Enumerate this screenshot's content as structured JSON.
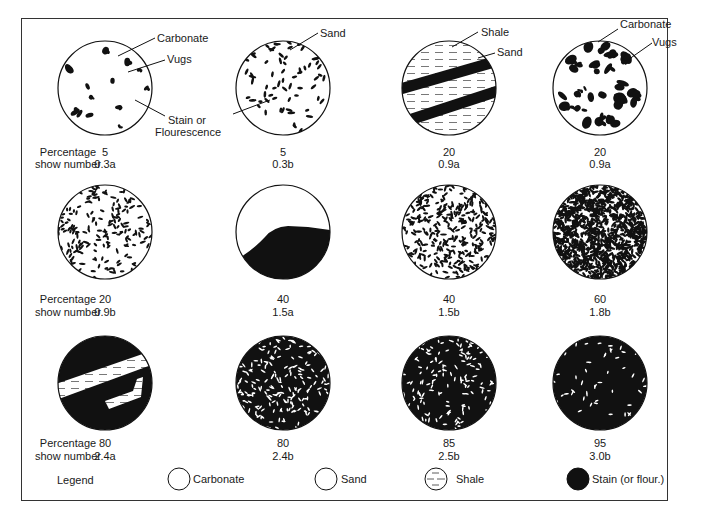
{
  "figure": {
    "row_label_percentage": "Percentage",
    "row_label_show": "show number",
    "samples": [
      {
        "pattern": "carbonate-vugs",
        "percentage": "5",
        "show_number": "0.3a",
        "stain_fraction": 0.05
      },
      {
        "pattern": "sand-stain",
        "percentage": "5",
        "show_number": "0.3b",
        "stain_fraction": 0.05
      },
      {
        "pattern": "shale-sand-bands",
        "percentage": "20",
        "show_number": "0.9a",
        "stain_fraction": 0.2
      },
      {
        "pattern": "carbonate-vugs",
        "percentage": "20",
        "show_number": "0.9a",
        "stain_fraction": 0.2
      },
      {
        "pattern": "sand-stain",
        "percentage": "20",
        "show_number": "0.9b",
        "stain_fraction": 0.2
      },
      {
        "pattern": "stain-partial",
        "percentage": "40",
        "show_number": "1.5a",
        "stain_fraction": 0.4
      },
      {
        "pattern": "sand-stain",
        "percentage": "40",
        "show_number": "1.5b",
        "stain_fraction": 0.4
      },
      {
        "pattern": "sand-stain",
        "percentage": "60",
        "show_number": "1.8b",
        "stain_fraction": 0.6
      },
      {
        "pattern": "stain-shale-bands",
        "percentage": "80",
        "show_number": "2.4a",
        "stain_fraction": 0.8
      },
      {
        "pattern": "stain-sand",
        "percentage": "80",
        "show_number": "2.4b",
        "stain_fraction": 0.8
      },
      {
        "pattern": "stain-sand",
        "percentage": "85",
        "show_number": "2.5b",
        "stain_fraction": 0.85
      },
      {
        "pattern": "stain-sand",
        "percentage": "95",
        "show_number": "3.0b",
        "stain_fraction": 0.95
      }
    ],
    "annotations": {
      "carbonate_1": "Carbonate",
      "vugs_1": "Vugs",
      "stain_1a": "Stain or",
      "stain_1b": "Flourescence",
      "sand_2": "Sand",
      "shale_3": "Shale",
      "sand_3": "Sand",
      "carbonate_4": "Carbonate",
      "vugs_4": "Vugs"
    }
  },
  "legend": {
    "title": "Legend",
    "items": [
      {
        "symbol": "carbonate",
        "label": "Carbonate"
      },
      {
        "symbol": "sand",
        "label": "Sand"
      },
      {
        "symbol": "shale",
        "label": "Shale"
      },
      {
        "symbol": "stain",
        "label": "Stain (or flour.)"
      }
    ]
  }
}
